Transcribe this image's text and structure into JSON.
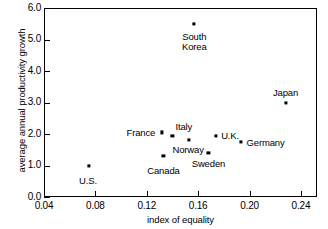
{
  "chart_data": {
    "type": "scatter",
    "title": "",
    "xlabel": "index of equality",
    "ylabel": "average annual productivity growth",
    "xlim": [
      0.04,
      0.2525
    ],
    "ylim": [
      0.0,
      6.0
    ],
    "grid": false,
    "legend": "none",
    "xticks": [
      "0.04",
      "0.08",
      "0.12",
      "0.16",
      "0.20",
      "0.24"
    ],
    "xtick_values": [
      0.04,
      0.08,
      0.12,
      0.16,
      0.2,
      0.24
    ],
    "yticks": [
      "0.0",
      "1.0",
      "2.0",
      "3.0",
      "4.0",
      "5.0",
      "6.0"
    ],
    "ytick_values": [
      0.0,
      1.0,
      2.0,
      3.0,
      4.0,
      5.0,
      6.0
    ],
    "points": [
      {
        "label": "U.S.",
        "x": 0.075,
        "y": 1.0,
        "label_pos": "below"
      },
      {
        "label": "Canada",
        "x": 0.133,
        "y": 1.3,
        "label_pos": "below"
      },
      {
        "label": "France",
        "x": 0.132,
        "y": 2.05,
        "label_pos": "left"
      },
      {
        "label": "Italy",
        "x": 0.14,
        "y": 1.93,
        "label_pos": "above-right"
      },
      {
        "label": "South\nKorea",
        "x": 0.157,
        "y": 5.5,
        "label_pos": "below"
      },
      {
        "label": "Norway",
        "x": 0.153,
        "y": 1.8,
        "label_pos": "below"
      },
      {
        "label": "Sweden",
        "x": 0.168,
        "y": 1.4,
        "label_pos": "below"
      },
      {
        "label": "U.K.",
        "x": 0.174,
        "y": 1.95,
        "label_pos": "right"
      },
      {
        "label": "Germany",
        "x": 0.193,
        "y": 1.75,
        "label_pos": "right"
      },
      {
        "label": "Japan",
        "x": 0.228,
        "y": 3.0,
        "label_pos": "above"
      }
    ]
  },
  "labels": {
    "us": "U.S.",
    "canada": "Canada",
    "france": "France",
    "italy": "Italy",
    "south_korea_line1": "South",
    "south_korea_line2": "Korea",
    "norway": "Norway",
    "sweden": "Sweden",
    "uk": "U.K.",
    "germany": "Germany",
    "japan": "Japan"
  },
  "axes": {
    "x_title": "index of equality",
    "y_title": "average annual productivity growth",
    "x_tick_labels": [
      "0.04",
      "0.08",
      "0.12",
      "0.16",
      "0.20",
      "0.24"
    ],
    "y_tick_labels": [
      "0.0",
      "1.0",
      "2.0",
      "3.0",
      "4.0",
      "5.0",
      "6.0"
    ]
  },
  "colors": {
    "axis": "#000000",
    "marker": "#000000",
    "background": "#ffffff"
  }
}
